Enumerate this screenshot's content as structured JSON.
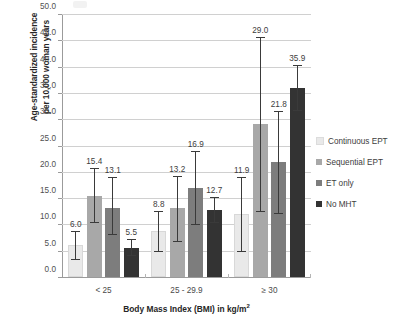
{
  "chart_data": {
    "type": "bar",
    "title": "",
    "subtitle": "",
    "xlabel": "Body Mass Index (BMI) in kg/m²",
    "ylabel": "Age-standardized incidence per 10,000 woman years",
    "ylabel_lines": [
      "Age-standardized incidence",
      "per 10,000 woman years"
    ],
    "categories": [
      "< 25",
      "25 - 29.9",
      "≥ 30"
    ],
    "ylim": [
      0.0,
      50.0
    ],
    "ytick_step": 5.0,
    "yticks": [
      "0.0",
      "5.0",
      "10.0",
      "15.0",
      "20.0",
      "25.0",
      "30.0",
      "35.0",
      "40.0",
      "45.0",
      "50.0"
    ],
    "ytick_values": [
      0,
      5,
      10,
      15,
      20,
      25,
      30,
      35,
      40,
      45,
      50
    ],
    "grid": true,
    "grid_axis": "y",
    "legend_position": "right",
    "error_bars": "95% confidence interval",
    "series": [
      {
        "name": "Continuous EPT",
        "color": "#e9e9e9",
        "values": [
          6.0,
          8.8,
          11.9
        ],
        "labels": [
          "6.0",
          "8.8",
          "11.9"
        ],
        "ci_low": [
          3.3,
          4.8,
          4.8
        ],
        "ci_high": [
          8.5,
          12.3,
          18.8
        ]
      },
      {
        "name": "Sequential EPT",
        "color": "#a8a8a8",
        "values": [
          15.4,
          13.2,
          29.0
        ],
        "labels": [
          "15.4",
          "13.2",
          "29.0"
        ],
        "ci_low": [
          10.2,
          6.6,
          12.3
        ],
        "ci_high": [
          20.5,
          19.0,
          45.5
        ]
      },
      {
        "name": "ET only",
        "color": "#7d7d7d",
        "values": [
          13.1,
          16.9,
          21.8
        ],
        "labels": [
          "13.1",
          "16.9",
          "21.8"
        ],
        "ci_low": [
          7.9,
          9.9,
          12.0
        ],
        "ci_high": [
          18.8,
          23.7,
          31.3
        ]
      },
      {
        "name": "No MHT",
        "color": "#333333",
        "values": [
          5.5,
          12.7,
          35.9
        ],
        "labels": [
          "5.5",
          "12.7",
          "35.9"
        ],
        "ci_low": [
          4.0,
          10.3,
          31.5
        ],
        "ci_high": [
          7.0,
          15.0,
          40.2
        ]
      }
    ]
  },
  "legend": {
    "items": [
      {
        "label": "Continuous EPT",
        "color": "#e9e9e9"
      },
      {
        "label": "Sequential EPT",
        "color": "#a8a8a8"
      },
      {
        "label": "ET only",
        "color": "#7d7d7d"
      },
      {
        "label": "No MHT",
        "color": "#333333"
      }
    ]
  }
}
